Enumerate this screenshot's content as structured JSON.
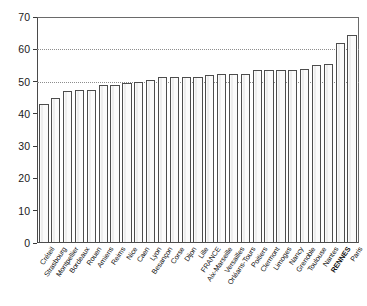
{
  "chart_data": {
    "type": "bar",
    "title": "",
    "subtitle": "",
    "xlabel": "",
    "ylabel": "",
    "ylim": [
      0,
      70
    ],
    "ytick_values": [
      0,
      10,
      20,
      30,
      40,
      50,
      60,
      70
    ],
    "ytick_labels": [
      "0",
      "10",
      "20",
      "30",
      "40",
      "50",
      "60",
      "70"
    ],
    "gridlines": [
      50,
      60
    ],
    "grid": "horizontal-dotted",
    "legend": "none",
    "bar_fill_color": "#fbfbfb",
    "bar_edge_color": "#4d4d4d",
    "axis_color": "#3a3a3a",
    "gridline_color": "#8d8d8d",
    "categories": [
      "Créteil",
      "Strasbourg",
      "Montpellier",
      "Bordeaux",
      "Rouen",
      "Amiens",
      "Reims",
      "Nice",
      "Caen",
      "Lyon",
      "Besançon",
      "Corse",
      "Dijon",
      "Lille",
      "FRANCE",
      "Aix-Marseille",
      "Versailles",
      "Orléans-Tours",
      "Poitiers",
      "Clermont",
      "Limoges",
      "Nancy",
      "Grenoble",
      "Toulouse",
      "Nantes",
      "RENNES",
      "Paris"
    ],
    "values": [
      43.0,
      45.0,
      47.0,
      47.5,
      47.5,
      49.0,
      49.0,
      49.5,
      50.0,
      50.5,
      51.5,
      51.5,
      51.5,
      51.5,
      52.0,
      52.5,
      52.5,
      52.5,
      53.5,
      53.5,
      53.5,
      53.5,
      54.0,
      55.0,
      55.5,
      62.0,
      64.5
    ],
    "highlighted_category": "RENNES"
  }
}
